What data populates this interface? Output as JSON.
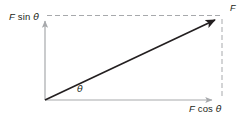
{
  "figure": {
    "type": "vector-decomposition-diagram",
    "background_color": "#ffffff"
  },
  "labels": {
    "vertical_component": {
      "magnitude": "F",
      "function": "sin",
      "angle": "θ",
      "full_text": "F sin θ"
    },
    "horizontal_component": {
      "magnitude": "F",
      "function": "cos",
      "angle": "θ",
      "full_text": "F cos θ"
    },
    "resultant_vector": "F",
    "angle_symbol": "θ"
  },
  "geometry": {
    "origin": {
      "x": 45,
      "y": 100
    },
    "vector_tip": {
      "x": 221,
      "y": 17
    },
    "x_axis_end": {
      "x": 217,
      "y": 100
    },
    "y_axis_end": {
      "x": 45,
      "y": 16
    },
    "dashed_top_line": {
      "x1": 47,
      "y1": 16,
      "x2": 222,
      "y2": 16
    },
    "dashed_right_line": {
      "x1": 222,
      "y1": 18,
      "x2": 222,
      "y2": 99
    }
  },
  "colors": {
    "vector_stroke": "#231f20",
    "axis_stroke": "#a7a9ac",
    "dashed_stroke": "#a7a9ac",
    "text": "#231f20"
  },
  "strokes": {
    "vector_width": 1.5,
    "axis_width": 1.2,
    "dashed_width": 1,
    "dash_pattern": "5,3"
  }
}
